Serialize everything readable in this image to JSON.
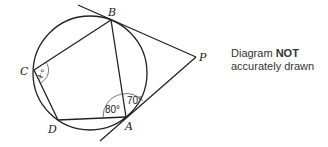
{
  "points": {
    "A": "A",
    "B": "B",
    "C": "C",
    "D": "D",
    "P": "P"
  },
  "angles": {
    "angle_DAB": "80°",
    "angle_BAP": "70°",
    "angle_C_var": "x",
    "angle_C_suffix": "°"
  },
  "note": {
    "line1_prefix": "Diagram ",
    "line1_bold": "NOT",
    "line2": "accurately drawn"
  },
  "colors": {
    "stroke": "#222222",
    "text": "#333333"
  }
}
